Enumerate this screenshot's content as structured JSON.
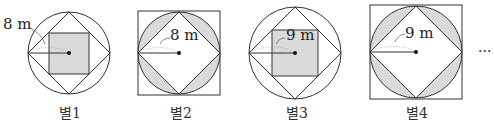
{
  "figures": [
    {
      "caption": "별1",
      "radius_label": "8 m",
      "type": "circle-diamond-inner-square"
    },
    {
      "caption": "별2",
      "radius_label": "8 m",
      "type": "square-circle-diamond"
    },
    {
      "caption": "별3",
      "radius_label": "9 m",
      "type": "circle-diamond-inner-square"
    },
    {
      "caption": "별4",
      "radius_label": "9 m",
      "type": "square-circle-diamond"
    }
  ],
  "continuation": "···",
  "colors": {
    "stroke": "#333333",
    "shade": "#d9d9d9"
  }
}
